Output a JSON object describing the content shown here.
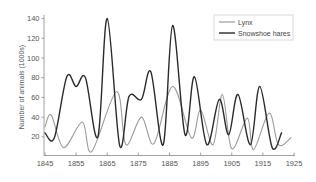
{
  "chart_data": {
    "type": "line",
    "title": "",
    "xlabel": "",
    "ylabel": "Number of animals (1000s)",
    "xlim": [
      1845,
      1925
    ],
    "ylim": [
      0,
      140
    ],
    "x_ticks": [
      "1845",
      "1855",
      "1865",
      "1875",
      "1885",
      "1895",
      "1905",
      "1915",
      "1925"
    ],
    "y_ticks": [
      "20",
      "40",
      "60",
      "80",
      "100",
      "120",
      "140"
    ],
    "grid": false,
    "legend_position": "upper right",
    "series": [
      {
        "name": "Lynx",
        "color": "#9a9a9a",
        "points": [
          [
            1845,
            30
          ],
          [
            1847,
            42
          ],
          [
            1851,
            9
          ],
          [
            1857,
            35
          ],
          [
            1860,
            5
          ],
          [
            1868,
            66
          ],
          [
            1871,
            12
          ],
          [
            1876,
            40
          ],
          [
            1880,
            13
          ],
          [
            1886,
            71
          ],
          [
            1892,
            19
          ],
          [
            1895,
            47
          ],
          [
            1899,
            12
          ],
          [
            1902,
            63
          ],
          [
            1905,
            8
          ],
          [
            1910,
            39
          ],
          [
            1912,
            7
          ],
          [
            1917,
            44
          ],
          [
            1920,
            12
          ],
          [
            1924,
            19
          ]
        ]
      },
      {
        "name": "Snowshoe hares",
        "color": "#2a2a2a",
        "points": [
          [
            1845,
            24
          ],
          [
            1848,
            19
          ],
          [
            1852,
            81
          ],
          [
            1855,
            71
          ],
          [
            1858,
            80
          ],
          [
            1862,
            20
          ],
          [
            1865,
            140
          ],
          [
            1869,
            11
          ],
          [
            1872,
            61
          ],
          [
            1876,
            58
          ],
          [
            1879,
            86
          ],
          [
            1883,
            12
          ],
          [
            1886,
            133
          ],
          [
            1890,
            22
          ],
          [
            1893,
            81
          ],
          [
            1897,
            12
          ],
          [
            1901,
            58
          ],
          [
            1904,
            22
          ],
          [
            1907,
            63
          ],
          [
            1911,
            12
          ],
          [
            1914,
            71
          ],
          [
            1918,
            9
          ],
          [
            1921,
            24
          ]
        ]
      }
    ]
  },
  "legend": {
    "items": [
      {
        "label": "Lynx",
        "color": "#9a9a9a"
      },
      {
        "label": "Snowshoe hares",
        "color": "#2a2a2a"
      }
    ]
  },
  "axis": {
    "ylabel": "Number of animals (1000s)"
  }
}
